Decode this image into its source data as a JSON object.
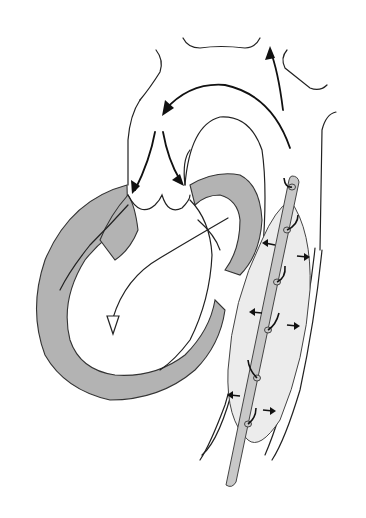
{
  "diagram": {
    "colors": {
      "background": "#ffffff",
      "myocardium": "#b3b3b3",
      "balloon": "#ececec",
      "catheter": "#c8c8c8",
      "lines": "#222222"
    },
    "elements": [
      {
        "id": "aortic-arch",
        "type": "vessel-outline"
      },
      {
        "id": "head-neck-branches",
        "type": "vessel-outline"
      },
      {
        "id": "descending-aorta",
        "type": "vessel-outline"
      },
      {
        "id": "left-ventricle",
        "type": "chamber"
      },
      {
        "id": "aortic-valve",
        "type": "valve"
      },
      {
        "id": "balloon",
        "type": "device"
      },
      {
        "id": "catheter",
        "type": "device"
      },
      {
        "id": "flow-arrows",
        "type": "annotation",
        "count": 4
      },
      {
        "id": "balloon-inflation-arrows",
        "type": "annotation",
        "count": 6
      }
    ]
  }
}
